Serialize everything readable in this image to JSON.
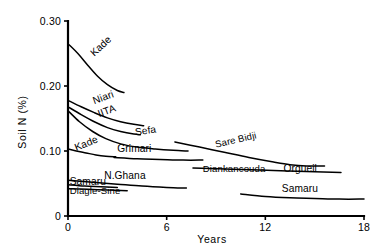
{
  "chart_data": {
    "type": "line",
    "title": "",
    "subtitle": "",
    "xlabel": "Years",
    "ylabel": "Soil N (%)",
    "xlim": [
      0,
      18
    ],
    "ylim": [
      0,
      0.3
    ],
    "grid": false,
    "legend": "inline-labels",
    "xticks": [
      "0",
      "6",
      "12",
      "18"
    ],
    "xtick_values": [
      0,
      6,
      12,
      18
    ],
    "yticks": [
      "0",
      "0.10",
      "0.20",
      "0.30"
    ],
    "ytick_values": [
      0,
      0.1,
      0.2,
      0.3
    ],
    "series": [
      {
        "name": "Kade",
        "label": "Kade",
        "x": [
          0,
          0.6,
          1.2,
          1.8,
          2.4,
          3.0,
          3.4
        ],
        "values": [
          0.265,
          0.25,
          0.232,
          0.215,
          0.202,
          0.193,
          0.19
        ]
      },
      {
        "name": "Niari",
        "label": "Niari",
        "x": [
          0,
          0.8,
          1.6,
          2.4,
          3.2,
          4.0,
          4.6
        ],
        "values": [
          0.178,
          0.168,
          0.159,
          0.151,
          0.145,
          0.141,
          0.139
        ]
      },
      {
        "name": "IITA",
        "label": "IITA",
        "x": [
          0,
          0.8,
          1.6,
          2.4,
          3.2,
          4.0,
          4.4
        ],
        "values": [
          0.168,
          0.156,
          0.145,
          0.136,
          0.13,
          0.126,
          0.125
        ]
      },
      {
        "name": "Sefa",
        "label": "Sefa",
        "x": [
          0,
          0.7,
          1.5,
          2.3,
          3.2,
          4.2,
          5.3,
          6.4,
          7.3
        ],
        "values": [
          0.162,
          0.145,
          0.13,
          0.119,
          0.111,
          0.106,
          0.103,
          0.101,
          0.1
        ]
      },
      {
        "name": "Kade-lower",
        "label": "Kade",
        "x": [
          0,
          0.5,
          1.1,
          1.7,
          2.3,
          2.9
        ],
        "values": [
          0.103,
          0.1,
          0.097,
          0.094,
          0.092,
          0.091
        ]
      },
      {
        "name": "Grimari",
        "label": "Grimari",
        "x": [
          2.8,
          4.2,
          5.6,
          7.0,
          8.2
        ],
        "values": [
          0.09,
          0.088,
          0.087,
          0.086,
          0.086
        ]
      },
      {
        "name": "Sare Bidji",
        "label": "Sare Bidji",
        "x": [
          6.5,
          8.0,
          9.5,
          11.0,
          12.5,
          13.5,
          14.5,
          15.6
        ],
        "values": [
          0.114,
          0.106,
          0.098,
          0.09,
          0.083,
          0.079,
          0.077,
          0.077
        ]
      },
      {
        "name": "Diankancouda",
        "label": "Diankancouda",
        "x": [
          7.6,
          10.0,
          12.5,
          15.0,
          16.6
        ],
        "values": [
          0.074,
          0.072,
          0.07,
          0.068,
          0.067
        ]
      },
      {
        "name": "Orgueil",
        "label": "Orgueil",
        "x": [
          7.6,
          10.0,
          12.5,
          15.0,
          16.6
        ],
        "values": [
          0.074,
          0.072,
          0.07,
          0.068,
          0.067
        ]
      },
      {
        "name": "N.Ghana",
        "label": "N.Ghana",
        "x": [
          0,
          1.5,
          3.0,
          4.5,
          6.0,
          7.2
        ],
        "values": [
          0.055,
          0.052,
          0.049,
          0.046,
          0.044,
          0.043
        ]
      },
      {
        "name": "Samaru-left",
        "label": "Samaru",
        "x": [
          0,
          1.0,
          2.0,
          3.0
        ],
        "values": [
          0.048,
          0.046,
          0.045,
          0.044
        ]
      },
      {
        "name": "Diagle-Sine",
        "label": "Diagle-Sine",
        "x": [
          0,
          1.2,
          2.4,
          3.6
        ],
        "values": [
          0.042,
          0.041,
          0.04,
          0.039
        ]
      },
      {
        "name": "Samaru-right",
        "label": "Samaru",
        "x": [
          10.5,
          12.0,
          13.5,
          15.0,
          16.5,
          18.0
        ],
        "values": [
          0.034,
          0.03,
          0.028,
          0.027,
          0.026,
          0.026
        ]
      }
    ],
    "annotations": [
      {
        "text": "Kade",
        "x": 1.6,
        "y": 0.245,
        "rotation": 43
      },
      {
        "text": "Niari",
        "x": 1.6,
        "y": 0.172,
        "rotation": 20
      },
      {
        "text": "IITA",
        "x": 1.9,
        "y": 0.152,
        "rotation": 20
      },
      {
        "text": "Sefa",
        "x": 4.1,
        "y": 0.124,
        "rotation": 8
      },
      {
        "text": "Kade",
        "x": 0.5,
        "y": 0.1,
        "rotation": 22
      },
      {
        "text": "Grimari",
        "x": 3.0,
        "y": 0.098,
        "rotation": 0
      },
      {
        "text": "Sare Bidji",
        "x": 9.0,
        "y": 0.105,
        "rotation": 13
      },
      {
        "text": "Diankancouda",
        "x": 8.2,
        "y": 0.067,
        "rotation": 0
      },
      {
        "text": "Orgueil",
        "x": 13.1,
        "y": 0.067,
        "rotation": 0
      },
      {
        "text": "N.Ghana",
        "x": 2.2,
        "y": 0.057,
        "rotation": 0
      },
      {
        "text": "Samaru",
        "x": 0.1,
        "y": 0.047,
        "rotation": 0
      },
      {
        "text": "Diagle-Sine",
        "x": 0.1,
        "y": 0.034,
        "rotation": 0
      },
      {
        "text": "Samaru",
        "x": 13.0,
        "y": 0.037,
        "rotation": 0
      }
    ]
  },
  "colors": {
    "background": "#ffffff",
    "ink": "#000000"
  }
}
